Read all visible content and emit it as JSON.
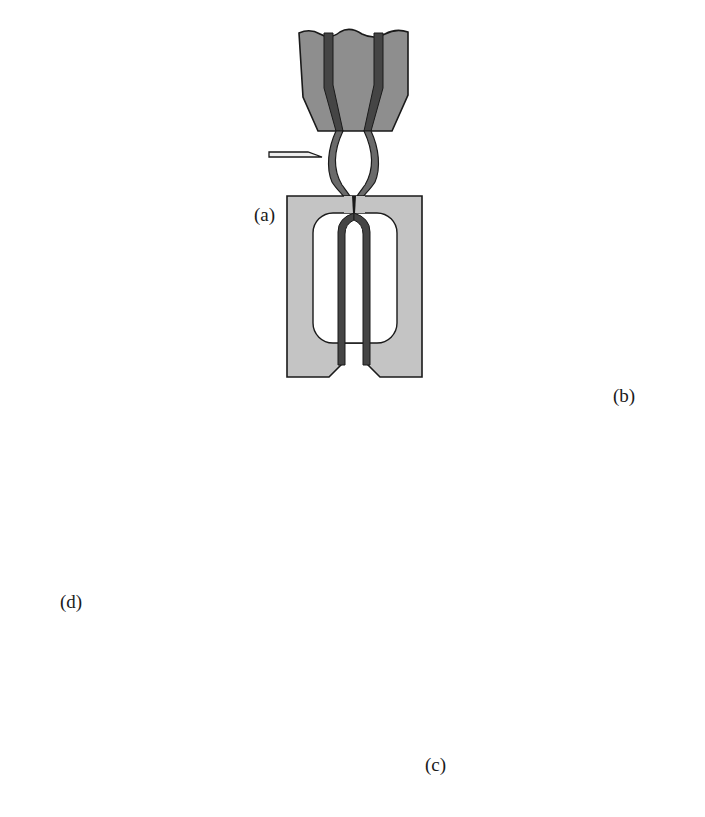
{
  "figure": {
    "colors": {
      "background": "#ffffff",
      "mold_fill": "#c4c4c4",
      "head_fill": "#8e8e8e",
      "material_fill": "#454545",
      "nozzle_fill": "#dedede",
      "outline": "#1a1a1a",
      "arrow": "#1a1a1a"
    },
    "stages": [
      {
        "id": "a",
        "label": "(a)",
        "caption": "extrusion head drops parison into closed mold; cutter blade at left"
      },
      {
        "id": "b",
        "label": "(b)",
        "caption": "mold rotated horizontal; blow pins inserted from left"
      },
      {
        "id": "c",
        "label": "(c)",
        "caption": "mold vertical with blow nozzle at top; part expanded to cavity"
      },
      {
        "id": "d",
        "label": "(d)",
        "caption": "mold halves opened; nozzle withdrawn; part released"
      }
    ],
    "arrows": [
      {
        "from": "d",
        "to": "a",
        "direction": "clockwise"
      },
      {
        "from": "a",
        "to": "b",
        "direction": "clockwise"
      },
      {
        "from": "b",
        "to": "c",
        "direction": "clockwise"
      },
      {
        "from": "c",
        "to": "d",
        "direction": "clockwise"
      }
    ]
  }
}
